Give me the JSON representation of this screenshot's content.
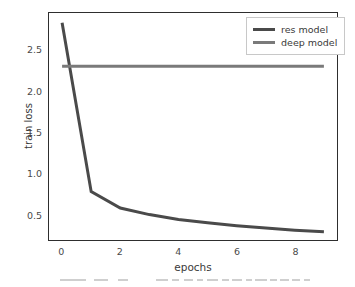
{
  "chart_data": {
    "type": "line",
    "title": "",
    "xlabel": "epochs",
    "ylabel": "train loss",
    "xlim": [
      -0.45,
      9.45
    ],
    "ylim": [
      0.18,
      2.95
    ],
    "xticks": [
      "0",
      "2",
      "4",
      "6",
      "8"
    ],
    "xtick_values": [
      0,
      2,
      4,
      6,
      8
    ],
    "yticks": [
      "0.5",
      "1.0",
      "1.5",
      "2.0",
      "2.5"
    ],
    "ytick_values": [
      0.5,
      1.0,
      1.5,
      2.0,
      2.5
    ],
    "grid": false,
    "legend_position": "upper right",
    "x": [
      0,
      1,
      2,
      3,
      4,
      5,
      6,
      7,
      8,
      9
    ],
    "series": [
      {
        "name": "res model",
        "color": "#4a4a4a",
        "values": [
          2.83,
          0.77,
          0.57,
          0.49,
          0.43,
          0.39,
          0.355,
          0.325,
          0.3,
          0.28
        ]
      },
      {
        "name": "deep model",
        "color": "#7a7a7a",
        "values": [
          2.3,
          2.3,
          2.3,
          2.3,
          2.3,
          2.3,
          2.3,
          2.3,
          2.3,
          2.3
        ]
      }
    ]
  },
  "legend": {
    "entries": [
      {
        "label": "res model"
      },
      {
        "label": "deep model"
      }
    ]
  },
  "axes": {
    "y_label": "train loss",
    "x_label": "epochs"
  },
  "colors": {
    "res_model": "#4a4a4a",
    "deep_model": "#7a7a7a",
    "axis": "#2e2e2e",
    "background": "#ffffff"
  }
}
